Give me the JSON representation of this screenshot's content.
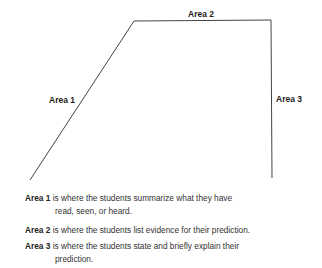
{
  "diagram": {
    "labels": {
      "area1": "Area 1",
      "area2": "Area 2",
      "area3": "Area 3"
    },
    "line_color": "#444444"
  },
  "legend": [
    {
      "term": "Area 1",
      "text": "is where the students summarize what they have",
      "cont": "read, seen, or heard."
    },
    {
      "term": "Area 2",
      "text": "is where the students list evidence for their prediction.",
      "cont": ""
    },
    {
      "term": "Area 3",
      "text": "is where the students state and briefly explain their",
      "cont": "prediction."
    }
  ]
}
